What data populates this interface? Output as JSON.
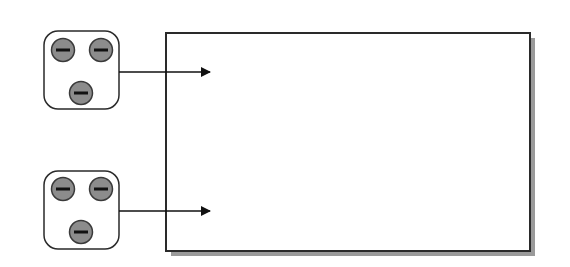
{
  "diagram": {
    "colors": {
      "background": "#ffffff",
      "stroke": "#2a2a2a",
      "charge_fill": "#8c8c8c",
      "shadow": "#9a9a9a"
    },
    "charge_symbol": "minus",
    "groups": [
      {
        "name": "upper-charge-group",
        "charges": 3,
        "arrow_y": 72
      },
      {
        "name": "lower-charge-group",
        "charges": 3,
        "arrow_y": 211
      }
    ],
    "region": {
      "label": ""
    }
  }
}
